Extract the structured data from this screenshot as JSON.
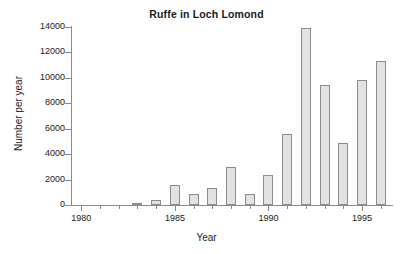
{
  "chart": {
    "title": "Ruffe in Loch Lomond",
    "xlabel": "Year",
    "ylabel": "Number per year"
  },
  "chart_data": {
    "type": "bar",
    "title": "Ruffe in Loch Lomond",
    "xlabel": "Year",
    "ylabel": "Number per year",
    "categories": [
      1980,
      1981,
      1982,
      1983,
      1984,
      1985,
      1986,
      1987,
      1988,
      1989,
      1990,
      1991,
      1992,
      1993,
      1994,
      1995,
      1996
    ],
    "values": [
      0,
      0,
      0,
      50,
      400,
      1550,
      830,
      1320,
      3000,
      860,
      2380,
      5600,
      13900,
      9450,
      4850,
      9830,
      11350
    ],
    "xlim": [
      1979.5,
      1996.6
    ],
    "ylim": [
      0,
      14000
    ],
    "ytick_values": [
      0,
      2000,
      4000,
      6000,
      8000,
      10000,
      12000,
      14000
    ],
    "ytick_labels": [
      "0",
      "2000",
      "4000",
      "6000",
      "8000",
      "10000",
      "12000",
      "14000"
    ],
    "xtick_major_values": [
      1980,
      1985,
      1990,
      1995
    ],
    "xtick_major_labels": [
      "1980",
      "1985",
      "1990",
      "1995"
    ],
    "xtick_minor_values": [
      1981,
      1982,
      1983,
      1984,
      1986,
      1987,
      1988,
      1989,
      1991,
      1992,
      1993,
      1994,
      1996
    ],
    "grid": false,
    "legend": null,
    "bar_fill_color": "#e2e2e2",
    "bar_edge_color": "#8d8d8d",
    "axis_color": "#8a8a8a",
    "text_color": "#1a1a1a",
    "background_color": "#ffffff"
  }
}
